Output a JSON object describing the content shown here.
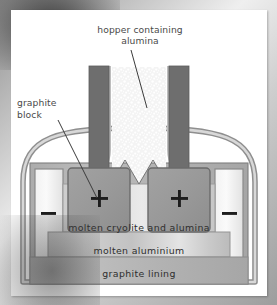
{
  "figure": {
    "callout_labels": [
      {
        "name": "hopper-label",
        "text": "hopper containing\nalumina"
      },
      {
        "name": "graphite-block-label",
        "text": "graphite\nblock"
      }
    ],
    "layer_labels": [
      {
        "name": "molten-cryolite-label",
        "text": "molten cryolite and alumina"
      },
      {
        "name": "molten-aluminium-label",
        "text": "molten aluminium"
      },
      {
        "name": "graphite-lining-label",
        "text": "graphite lining"
      }
    ],
    "electrode_signs": [
      {
        "name": "anode-left-sign",
        "text": "+"
      },
      {
        "name": "anode-right-sign",
        "text": "+"
      },
      {
        "name": "cathode-left-sign",
        "text": "–"
      },
      {
        "name": "cathode-right-sign",
        "text": "–"
      }
    ],
    "colors": {
      "background_grey": "#b9b9b9",
      "panel_white": "#ffffff",
      "electrode_dark": "#6e6e6e",
      "anode_block": "#9a9a9a",
      "vessel_wall": "#c9c9c9",
      "vessel_wall_stroke": "#8d8d8d",
      "cryolite_fill": "#d7d7d7",
      "aluminium_fill": "#c4c4c4",
      "lining_fill": "#b0b0b0",
      "alumina_speckle": "#efefef",
      "text_label": "#4a4a4a",
      "text_inner": "#2e2e2e",
      "leader_line": "#3a3a3a"
    }
  }
}
